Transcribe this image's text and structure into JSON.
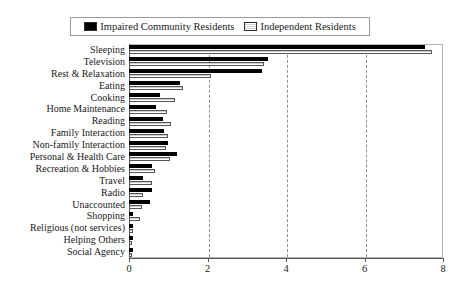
{
  "legend": {
    "entries": [
      {
        "label": "Impaired Community Residents",
        "swatch": "black-square-icon",
        "color": "#000000"
      },
      {
        "label": "Independent Residents",
        "swatch": "light-hatched-square-icon",
        "color": "#ececec"
      }
    ]
  },
  "axis": {
    "ticks": [
      "0",
      "2",
      "4",
      "6",
      "8"
    ],
    "gridlines": [
      2,
      4,
      6
    ]
  },
  "chart_data": {
    "type": "bar",
    "orientation": "horizontal",
    "title": "",
    "subtitle": "",
    "xlabel": "",
    "ylabel": "",
    "xlim": [
      0,
      8
    ],
    "xticks": [
      0,
      2,
      4,
      6,
      8
    ],
    "grid": true,
    "legend_position": "top",
    "categories": [
      "Sleeping",
      "Television",
      "Rest & Relaxation",
      "Eating",
      "Cooking",
      "Home Maintenance",
      "Reading",
      "Family Interaction",
      "Non-family Interaction",
      "Personal & Health Care",
      "Recreation & Hobbies",
      "Travel",
      "Radio",
      "Unaccounted",
      "Shopping",
      "Religious (not services)",
      "Helping Others",
      "Social Agency"
    ],
    "series": [
      {
        "name": "Impaired Community Residents",
        "color": "#000000",
        "values": [
          7.55,
          3.55,
          3.4,
          1.3,
          0.79,
          0.69,
          0.87,
          0.89,
          0.99,
          1.22,
          0.59,
          0.36,
          0.59,
          0.54,
          0.11,
          0.11,
          0.1,
          0.1
        ]
      },
      {
        "name": "Independent Residents",
        "color": "#ececec",
        "values": [
          7.72,
          3.45,
          2.1,
          1.37,
          1.17,
          0.97,
          1.07,
          0.99,
          0.94,
          1.04,
          0.66,
          0.59,
          0.36,
          0.34,
          0.27,
          0.1,
          0.08,
          0.07
        ]
      }
    ]
  }
}
